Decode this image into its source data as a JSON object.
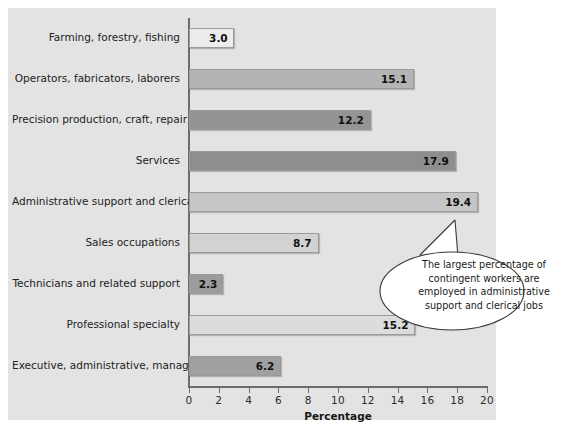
{
  "chart_data": {
    "type": "bar",
    "orientation": "horizontal",
    "title": "",
    "xlabel": "Percentage",
    "ylabel": "",
    "xlim": [
      0,
      20
    ],
    "xticks": [
      0,
      2,
      4,
      6,
      8,
      10,
      12,
      14,
      16,
      18,
      20
    ],
    "grid": false,
    "categories": [
      "Farming, forestry, fishing",
      "Operators, fabricators, laborers",
      "Precision production, craft, repair",
      "Services",
      "Administrative support and clerical",
      "Sales occupations",
      "Technicians and related support",
      "Professional specialty",
      "Executive, administrative, managerial"
    ],
    "values": [
      3.0,
      15.1,
      12.2,
      17.9,
      19.4,
      8.7,
      2.3,
      15.2,
      6.2
    ],
    "value_labels": [
      "3.0",
      "15.1",
      "12.2",
      "17.9",
      "19.4",
      "8.7",
      "2.3",
      "15.2",
      "6.2"
    ],
    "bar_colors": [
      "#ececec",
      "#b4b4b4",
      "#949494",
      "#8e8e8e",
      "#c6c6c6",
      "#d2d2d2",
      "#9c9c9c",
      "#dcdcdc",
      "#a0a0a0"
    ],
    "annotations": [
      {
        "name": "largest-percentage-callout",
        "text": "The largest percentage of contingent workers are employed in administrative support and clerical jobs",
        "lines": [
          "The largest percentage of",
          "contingent workers are",
          "employed in administrative",
          "support and clerical jobs"
        ],
        "points_to_category": "Administrative support and clerical"
      }
    ]
  },
  "axis": {
    "x_title": "Percentage",
    "tick_labels": [
      "0",
      "2",
      "4",
      "6",
      "8",
      "10",
      "12",
      "14",
      "16",
      "18",
      "20"
    ]
  },
  "colors": {
    "panel_background": "#e3e3e3",
    "page_background": "#ffffff",
    "axis_line": "#6d6d6d",
    "bar_border": "#9a9a9a",
    "text": "#222222",
    "callout_fill": "#ffffff",
    "callout_stroke": "#3a3a3a"
  }
}
